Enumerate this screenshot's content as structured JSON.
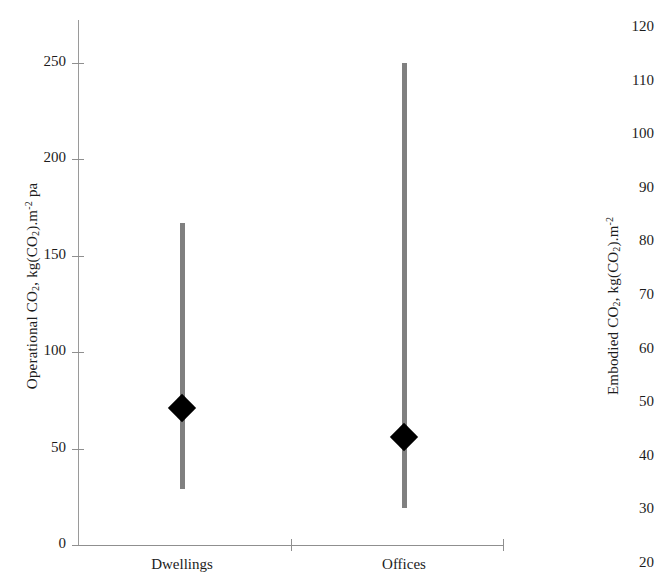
{
  "chart_data": {
    "type": "bar",
    "subtype": "range-bar-with-median-marker",
    "title": "",
    "subtitle": "",
    "categories": [
      "Dwellings",
      "Offices"
    ],
    "xlabel": "",
    "ylabel": "Operational CO2, kg(CO2).m-2 pa",
    "y2label": "Embodied CO2, kg(CO2).m-2",
    "ylim": [
      0,
      270
    ],
    "y2lim": [
      16,
      125
    ],
    "yticks": [
      0,
      50,
      100,
      150,
      200,
      250
    ],
    "y2ticks": [
      20,
      30,
      40,
      50,
      60,
      70,
      80,
      90,
      100,
      110,
      120
    ],
    "grid": false,
    "legend": null,
    "series": [
      {
        "name": "Operational CO2 range",
        "low": [
          29,
          19
        ],
        "high": [
          167,
          250
        ],
        "marker": [
          71,
          56
        ],
        "marker_shape": "diamond",
        "bar_color": "#808080",
        "marker_color": "#000000"
      }
    ],
    "annotations": []
  },
  "left_axis": {
    "title_parts": {
      "prefix": "Operational CO",
      "sub1": "2",
      "mid": ", kg(CO",
      "sub2": "2",
      "mid2": ").m",
      "sup": "-2",
      "suffix": " pa"
    },
    "ticks": [
      {
        "label": "250",
        "value": 250
      },
      {
        "label": "200",
        "value": 200
      },
      {
        "label": "150",
        "value": 150
      },
      {
        "label": "100",
        "value": 100
      },
      {
        "label": "50",
        "value": 50
      },
      {
        "label": "0",
        "value": 0
      }
    ]
  },
  "right_axis": {
    "title_parts": {
      "prefix": "Embodied CO",
      "sub1": "2",
      "mid": ", kg(CO",
      "sub2": "2",
      "mid2": ").m",
      "sup": "-2"
    },
    "ticks": [
      {
        "label": "120",
        "value": 120
      },
      {
        "label": "110",
        "value": 110
      },
      {
        "label": "100",
        "value": 100
      },
      {
        "label": "90",
        "value": 90
      },
      {
        "label": "80",
        "value": 80
      },
      {
        "label": "70",
        "value": 70
      },
      {
        "label": "60",
        "value": 60
      },
      {
        "label": "50",
        "value": 50
      },
      {
        "label": "40",
        "value": 40
      },
      {
        "label": "30",
        "value": 30
      },
      {
        "label": "20",
        "value": 20
      }
    ]
  },
  "x_axis": {
    "categories": [
      {
        "label": "Dwellings"
      },
      {
        "label": "Offices"
      }
    ]
  },
  "colors": {
    "bar": "#808080",
    "marker": "#000000",
    "axis": "#8f8f8f",
    "text": "#1c1c1c",
    "background": "#ffffff"
  }
}
